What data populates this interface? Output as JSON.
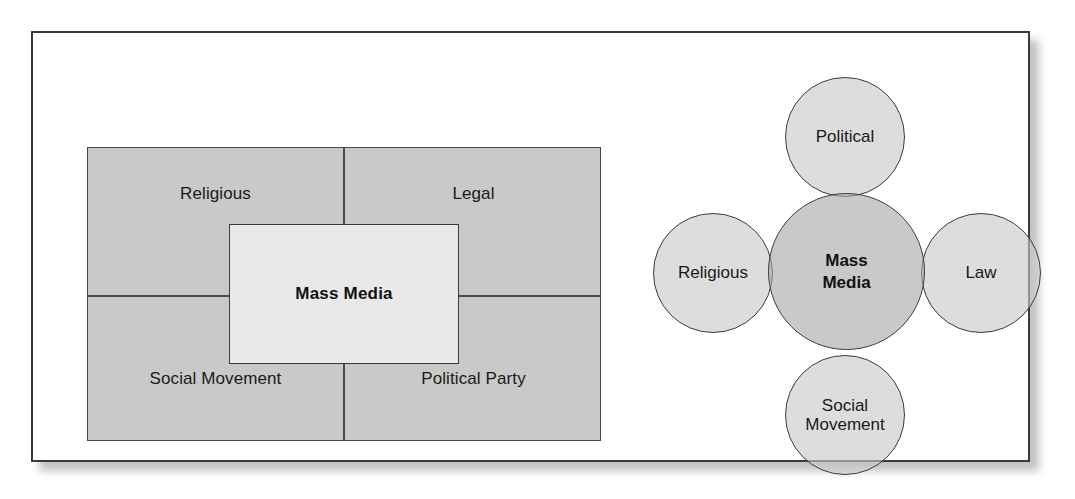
{
  "figure": {
    "panels": 2
  },
  "quadrant_diagram": {
    "center_label": "Mass Media",
    "quadrants": [
      {
        "position": "top-left",
        "label": "Religious"
      },
      {
        "position": "top-right",
        "label": "Legal"
      },
      {
        "position": "bottom-left",
        "label": "Social Movement"
      },
      {
        "position": "bottom-right",
        "label": "Political Party"
      }
    ],
    "colors": {
      "outer_fill": "#c9c9c9",
      "center_fill": "#e9e9e9",
      "line": "#4a4a4a"
    }
  },
  "circle_diagram": {
    "center_label": "Mass\nMedia",
    "center_label_line1": "Mass",
    "center_label_line2": "Media",
    "satellites": [
      {
        "position": "top",
        "label": "Political"
      },
      {
        "position": "left",
        "label": "Religious"
      },
      {
        "position": "right",
        "label": "Law"
      },
      {
        "position": "bottom",
        "label_line1": "Social",
        "label_line2": "Movement"
      }
    ],
    "colors": {
      "center_fill": "#a8a8a8",
      "satellite_fill": "#c8c8c8",
      "stroke": "#3c3c3c"
    }
  },
  "frame": {
    "border_color": "#3a3a3a",
    "background": "#ffffff"
  }
}
